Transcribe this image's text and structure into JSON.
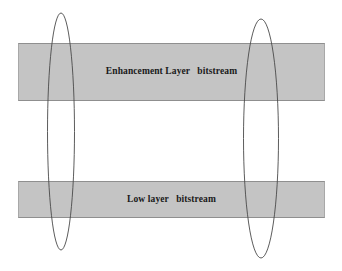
{
  "figure": {
    "canvas": {
      "width": 342,
      "height": 271,
      "background": "#ffffff"
    },
    "palette": {
      "bar_fill": "#c4c4c4",
      "bar_border": "#8f8f8f",
      "text_color": "#1a1a1a",
      "ellipse_stroke": "#4a4a4a"
    },
    "bars": [
      {
        "key": "enhancement",
        "label": "Enhancement Layer   bitstream",
        "x": 18,
        "y": 43,
        "width": 307,
        "height": 58
      },
      {
        "key": "low",
        "label": "Low layer   bitstream",
        "x": 18,
        "y": 181,
        "width": 307,
        "height": 37
      }
    ],
    "ellipses": [
      {
        "key": "left-marker",
        "name": "left-ellipse-marker",
        "cx": 61,
        "cy": 131.5,
        "rx": 13.5,
        "ry": 118.5
      },
      {
        "key": "right-marker",
        "name": "right-ellipse-marker",
        "cx": 261,
        "cy": 138.5,
        "rx": 17.5,
        "ry": 119.5
      }
    ]
  }
}
